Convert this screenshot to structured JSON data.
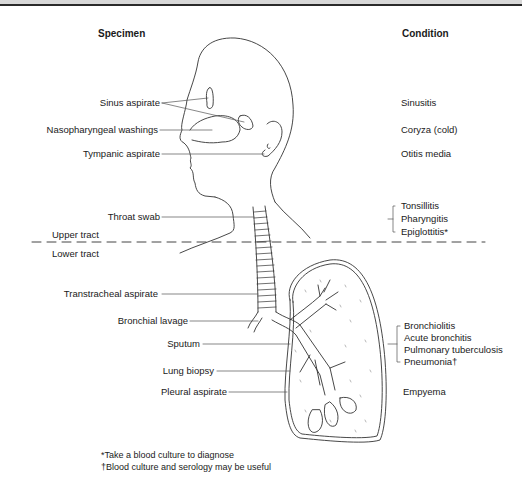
{
  "headers": {
    "specimen": "Specimen",
    "condition": "Condition"
  },
  "regions": {
    "upper": "Upper tract",
    "lower": "Lower tract"
  },
  "specimens": [
    "Sinus aspirate",
    "Nasopharyngeal washings",
    "Tympanic aspirate",
    "Throat swab",
    "Transtracheal aspirate",
    "Bronchial lavage",
    "Sputum",
    "Lung biopsy",
    "Pleural aspirate"
  ],
  "conditions": {
    "sinusitis": "Sinusitis",
    "coryza": "Coryza (cold)",
    "otitis": "Otitis media",
    "throat_group": [
      "Tonsillitis",
      "Pharyngitis",
      "Epiglottitis*"
    ],
    "lung_group": [
      "Bronchiolitis",
      "Acute bronchitis",
      "Pulmonary tuberculosis",
      "Pneumonia†"
    ],
    "empyema": "Empyema"
  },
  "footnotes": [
    "*Take a blood culture to diagnose",
    "†Blood culture and serology may be useful"
  ]
}
